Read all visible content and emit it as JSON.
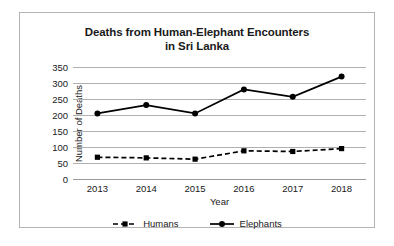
{
  "chart_data": {
    "type": "line",
    "title": "Deaths from Human-Elephant Encounters in Sri Lanka",
    "title_line1": "Deaths from Human-Elephant Encounters",
    "title_line2": "in Sri Lanka",
    "xlabel": "Year",
    "ylabel": "Number of Deaths",
    "categories": [
      "2013",
      "2014",
      "2015",
      "2016",
      "2017",
      "2018"
    ],
    "ylim": [
      0,
      350
    ],
    "yticks": [
      0,
      50,
      100,
      150,
      200,
      250,
      300,
      350
    ],
    "ytick_labels": [
      "0",
      "50",
      "100",
      "150",
      "200",
      "250",
      "300",
      "350"
    ],
    "grid": true,
    "legend_position": "bottom",
    "series": [
      {
        "name": "Humans",
        "values": [
          68,
          66,
          62,
          88,
          86,
          95
        ],
        "line_style": "dashed",
        "marker": "square",
        "color": "#000000"
      },
      {
        "name": "Elephants",
        "values": [
          205,
          231,
          205,
          280,
          257,
          320
        ],
        "line_style": "solid",
        "marker": "circle",
        "color": "#000000"
      }
    ]
  },
  "legend": {
    "items": [
      {
        "label": "Humans"
      },
      {
        "label": "Elephants"
      }
    ]
  },
  "colors": {
    "ink": "#1a1a1a",
    "gridline": "#b0b0b0",
    "frame": "#b4b4b4",
    "series": "#000000"
  }
}
